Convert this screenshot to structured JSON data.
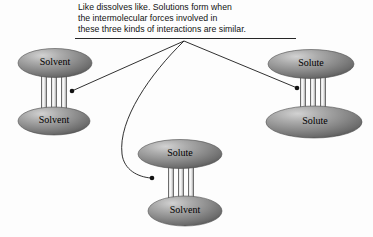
{
  "figure": {
    "caption": {
      "lines": [
        "Like dissolves like. Solutions form when",
        "the intermolecular forces involved in",
        "these three kinds of interactions are similar."
      ],
      "full_text": "Like dissolves like. Solutions form when the intermolecular forces involved in these three kinds of interactions are similar."
    },
    "background_color": "#fdfdfd",
    "line_color": "#1a1a1a",
    "text_color": "#111111"
  },
  "colors": {
    "blob_highlight": "#c9c9c9",
    "blob_mid": "#8e8e8e",
    "blob_dark": "#5d5d5d",
    "blob_edge": "#4a4a4a",
    "bar_light": "#f0f0f0",
    "bar_shade": "#9a9a9a",
    "bar_edge": "#4f4f4f",
    "underline": "#222222"
  },
  "interactions": [
    {
      "id": "solvent-solvent",
      "name": "Solvent-Solvent interaction",
      "top_label": "Solvent",
      "bottom_label": "Solvent",
      "top_ellipse": {
        "cx": 55,
        "cy": 63,
        "rx": 37,
        "ry": 14
      },
      "bottom_ellipse": {
        "cx": 54,
        "cy": 121,
        "rx": 36,
        "ry": 14
      },
      "bars": {
        "x_positions": [
          44,
          54,
          64
        ],
        "top": 63,
        "bottom": 121,
        "width": 5
      },
      "leader_dot": {
        "x": 72,
        "y": 91
      }
    },
    {
      "id": "solute-solute",
      "name": "Solute-Solute interaction",
      "top_label": "Solute",
      "bottom_label": "Solute",
      "top_ellipse": {
        "cx": 311,
        "cy": 64,
        "rx": 43,
        "ry": 14
      },
      "bottom_ellipse": {
        "cx": 314,
        "cy": 122,
        "rx": 48,
        "ry": 16
      },
      "bars": {
        "x_positions": [
          303,
          313,
          323
        ],
        "top": 64,
        "bottom": 122,
        "width": 5
      },
      "leader_dot": {
        "x": 297,
        "y": 88
      }
    },
    {
      "id": "solute-solvent",
      "name": "Solute-Solvent interaction",
      "top_label": "Solute",
      "bottom_label": "Solvent",
      "top_ellipse": {
        "cx": 180,
        "cy": 154,
        "rx": 42,
        "ry": 14
      },
      "bottom_ellipse": {
        "cx": 185,
        "cy": 211,
        "rx": 37,
        "ry": 15
      },
      "bars": {
        "x_positions": [
          171,
          181,
          191
        ],
        "top": 154,
        "bottom": 211,
        "width": 5
      },
      "leader_dot": {
        "x": 152,
        "y": 178
      }
    }
  ],
  "leader_lines": {
    "origin": {
      "x": 184,
      "y": 41
    },
    "underline": {
      "x1": 75,
      "y": 38,
      "x2": 296
    }
  }
}
